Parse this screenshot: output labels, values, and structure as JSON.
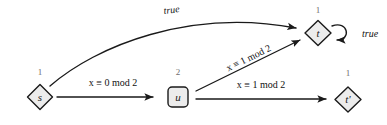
{
  "diagram": {
    "kind": "transition-system",
    "background_color": "#ffffff",
    "node_fill_color": "#ececec",
    "stroke_color": "#1a1a1a",
    "count_label_color": "#6e6e6e",
    "nodes": [
      {
        "id": "s",
        "label": "s",
        "count": "1",
        "shape": "diamond",
        "x": 40,
        "y": 97,
        "count_x": 40,
        "count_y": 72
      },
      {
        "id": "u",
        "label": "u",
        "count": "2",
        "shape": "rounded-square",
        "x": 178,
        "y": 97,
        "count_x": 178,
        "count_y": 72
      },
      {
        "id": "t",
        "label": "t",
        "count": "1",
        "shape": "diamond",
        "x": 318,
        "y": 33,
        "count_x": 318,
        "count_y": 10
      },
      {
        "id": "tp",
        "label": "t'",
        "count": "1",
        "shape": "diamond",
        "x": 348,
        "y": 100,
        "count_x": 348,
        "count_y": 73
      }
    ],
    "edges": [
      {
        "id": "s-to-t",
        "from": "s",
        "to": "t",
        "label": "true",
        "style": "curved",
        "label_italic": true,
        "label_x": 172,
        "label_y": 13,
        "label_rotation": -7
      },
      {
        "id": "s-to-u",
        "from": "s",
        "to": "u",
        "label": "x ≡ 0  mod 2",
        "style": "straight",
        "label_italic": false,
        "label_x": 113,
        "label_y": 86,
        "label_rotation": 0
      },
      {
        "id": "u-to-t",
        "from": "u",
        "to": "t",
        "label": "x ≡ 1  mod 2",
        "style": "straight",
        "label_italic": false,
        "label_x": 260,
        "label_y": 58,
        "label_rotation": -25
      },
      {
        "id": "u-to-tp",
        "from": "u",
        "to": "tp",
        "label": "x ≡ 1  mod 2",
        "style": "straight",
        "label_italic": false,
        "label_x": 260,
        "label_y": 86,
        "label_rotation": 0
      },
      {
        "id": "t-self",
        "from": "t",
        "to": "t",
        "label": "true",
        "style": "self-loop",
        "label_italic": true,
        "label_x": 362,
        "label_y": 37,
        "label_rotation": 0
      }
    ]
  }
}
